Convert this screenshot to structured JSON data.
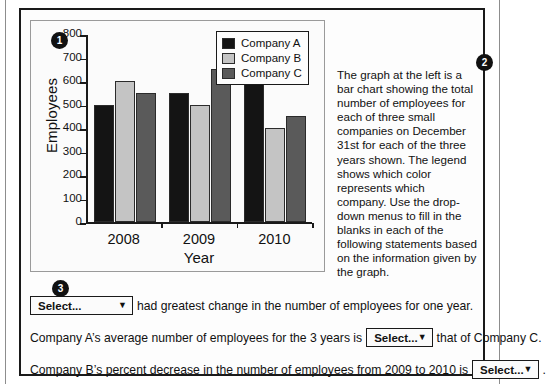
{
  "badges": {
    "one": "1",
    "two": "2",
    "three": "3"
  },
  "chart_data": {
    "type": "bar",
    "title": "",
    "xlabel": "Year",
    "ylabel": "Employees",
    "categories": [
      "2008",
      "2009",
      "2010"
    ],
    "series": [
      {
        "name": "Company A",
        "color": "#141414",
        "values": [
          500,
          550,
          600
        ]
      },
      {
        "name": "Company B",
        "color": "#c4c4c4",
        "values": [
          600,
          500,
          400
        ]
      },
      {
        "name": "Company C",
        "color": "#5a5a5a",
        "values": [
          550,
          650,
          450
        ]
      }
    ],
    "ylim": [
      0,
      800
    ],
    "yticks": [
      0,
      100,
      200,
      300,
      400,
      500,
      600,
      700,
      800
    ],
    "ytick_labels": [
      "0",
      "100",
      "200",
      "300",
      "400",
      "500",
      "600",
      "700",
      "800"
    ],
    "grid": false,
    "legend_position": "top-right",
    "legend_entries": [
      "Company A",
      "Company B",
      "Company C"
    ]
  },
  "description": {
    "text": "The graph at the left is a bar chart showing the total number of employees for each of three small companies on December 31st for each of the three years shown. The legend shows which color represents which company. Use the drop-down menus to fill in the blanks in each of the following statements based on the information given by the graph."
  },
  "statements": [
    {
      "id": "statement-1",
      "pre": "",
      "dropdown_value": "Select...",
      "post": "had greatest change in the number of employees for one year."
    },
    {
      "id": "statement-2",
      "pre": "Company A’s average number of employees for the 3 years is",
      "dropdown_value": "Select...",
      "post": "that of Company C."
    },
    {
      "id": "statement-3",
      "pre": "Company B’s percent decrease in the number of employees from 2009 to 2010 is",
      "dropdown_value": "Select...",
      "post": "."
    }
  ],
  "icons": {
    "caret": "▼"
  }
}
